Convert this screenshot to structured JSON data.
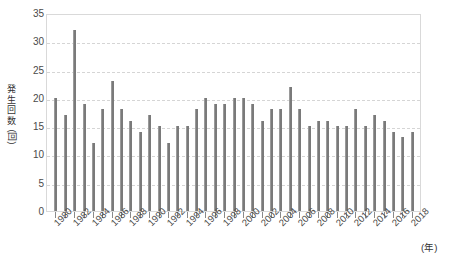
{
  "chart_data": {
    "type": "bar",
    "title": "",
    "subtitle": "",
    "xlabel": "(年)",
    "ylabel": "発生回数",
    "ylabel_unit": "(回)",
    "ylim": [
      0,
      35
    ],
    "ytick_step": 5,
    "yticks": [
      "0",
      "5",
      "10",
      "15",
      "20",
      "25",
      "30",
      "35"
    ],
    "grid": true,
    "legend": null,
    "legend_position": "none",
    "xtick_step": 2,
    "xticks": [
      "1980",
      "1982",
      "1984",
      "1986",
      "1988",
      "1990",
      "1992",
      "1994",
      "1996",
      "1998",
      "2000",
      "2002",
      "2004",
      "2006",
      "2008",
      "2010",
      "2012",
      "2014",
      "2016",
      "2018"
    ],
    "categories": [
      "1980",
      "1981",
      "1982",
      "1983",
      "1984",
      "1985",
      "1986",
      "1987",
      "1988",
      "1989",
      "1990",
      "1991",
      "1992",
      "1993",
      "1994",
      "1995",
      "1996",
      "1997",
      "1998",
      "1999",
      "2000",
      "2001",
      "2002",
      "2003",
      "2004",
      "2005",
      "2006",
      "2007",
      "2008",
      "2009",
      "2010",
      "2011",
      "2012",
      "2013",
      "2014",
      "2015",
      "2016",
      "2017",
      "2018"
    ],
    "values": [
      20,
      17,
      32,
      19,
      12,
      18,
      23,
      18,
      16,
      14,
      17,
      15,
      12,
      15,
      15,
      18,
      20,
      19,
      19,
      20,
      20,
      19,
      16,
      18,
      18,
      22,
      18,
      15,
      16,
      16,
      15,
      15,
      18,
      15,
      17,
      16,
      14,
      13,
      14
    ],
    "bar_color": "#7a7a7a",
    "grid_color": "#d5d5d5",
    "frame_color": "#d9d9d9",
    "background_color": "#ffffff"
  }
}
